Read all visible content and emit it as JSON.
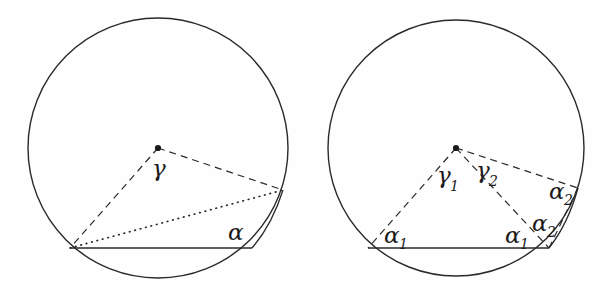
{
  "figure": {
    "background_color": "#fefefe",
    "stroke_color": "#2a2a2a",
    "panels": [
      {
        "name": "left-panel",
        "circle": {
          "cx": 158,
          "cy": 148,
          "r": 130
        },
        "center_point": {
          "x": 158,
          "y": 148,
          "label": "center-dot"
        },
        "chord": {
          "x1": 70,
          "y1": 248,
          "x2": 252,
          "y2": 248,
          "style": "solid"
        },
        "arc_point": {
          "x": 283,
          "y": 190
        },
        "radii": [
          {
            "from": "center",
            "to": "chord-left",
            "style": "dashed"
          },
          {
            "from": "center",
            "to": "arc-point",
            "style": "dashed"
          }
        ],
        "dotted_chord": {
          "x1": 70,
          "y1": 248,
          "x2": 283,
          "y2": 190,
          "style": "dotted"
        },
        "labels": [
          {
            "name": "gamma",
            "text": "γ",
            "sub": "",
            "x": 152,
            "y": 176
          },
          {
            "name": "alpha",
            "text": "α",
            "sub": "",
            "x": 228,
            "y": 240
          }
        ]
      },
      {
        "name": "right-panel",
        "circle": {
          "cx": 456,
          "cy": 148,
          "r": 128
        },
        "center_point": {
          "x": 456,
          "y": 148,
          "label": "center-dot"
        },
        "chord": {
          "x1": 368,
          "y1": 248,
          "x2": 549,
          "y2": 248,
          "style": "solid"
        },
        "arc_point": {
          "x": 578,
          "y": 188
        },
        "radii": [
          {
            "from": "center",
            "to": "chord-left",
            "style": "dashed"
          },
          {
            "from": "center",
            "to": "chord-right",
            "style": "dashed"
          },
          {
            "from": "center",
            "to": "arc-point",
            "style": "dashed"
          },
          {
            "from": "chord-right",
            "to": "arc-point",
            "style": "dashed"
          }
        ],
        "labels": [
          {
            "name": "gamma-1",
            "text": "γ",
            "sub": "1",
            "x": 443,
            "y": 185
          },
          {
            "name": "gamma-2",
            "text": "γ",
            "sub": "2",
            "x": 481,
            "y": 180
          },
          {
            "name": "alpha-1-left",
            "text": "α",
            "sub": "1",
            "x": 386,
            "y": 243
          },
          {
            "name": "alpha-1-right",
            "text": "α",
            "sub": "1",
            "x": 508,
            "y": 243
          },
          {
            "name": "alpha-2-lower",
            "text": "α",
            "sub": "2",
            "x": 535,
            "y": 231
          },
          {
            "name": "alpha-2-upper",
            "text": "α",
            "sub": "2",
            "x": 552,
            "y": 199
          }
        ]
      }
    ]
  }
}
